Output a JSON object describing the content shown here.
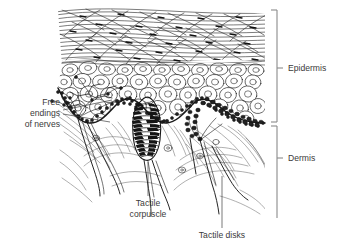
{
  "figure": {
    "width": 340,
    "height": 250,
    "background_color": "#ffffff",
    "ink_color": "#1a1a1a",
    "label_color": "#3a3a3a",
    "bracket_color": "#8a8a8a"
  },
  "labels": {
    "epidermis": "Epidermis",
    "dermis": "Dermis",
    "free_endings_line1": "Free",
    "free_endings_line2": "endings",
    "free_endings_line3": "of nerves",
    "tactile_corpuscle_line1": "Tactile",
    "tactile_corpuscle_line2": "corpuscle",
    "tactile_disks": "Tactile disks"
  },
  "regions": [
    {
      "name": "epidermis",
      "label": "Epidermis",
      "bracket_top": 10,
      "bracket_bottom": 122,
      "label_x": 288,
      "label_y": 70
    },
    {
      "name": "dermis",
      "label": "Dermis",
      "bracket_top": 126,
      "bracket_bottom": 218,
      "label_x": 288,
      "label_y": 158
    }
  ],
  "structures": [
    {
      "name": "stratum-corneum",
      "description": "Wavy keratinized horizontal fiber layer at the top of the epidermis"
    },
    {
      "name": "stratum-spinosum",
      "description": "Polygonal nucleated cells forming the bulk of the epidermis"
    },
    {
      "name": "stratum-basale",
      "description": "Dark granular basal cell layer following the dermal papillae contour"
    },
    {
      "name": "tactile-corpuscle",
      "description": "Elongated oval Meissner corpuscle with stacked lamellae inside a dermal papilla"
    },
    {
      "name": "tactile-disks",
      "description": "Merkel disk cluster on the right dermal papilla"
    },
    {
      "name": "free-nerve-endings",
      "description": "Branching unencapsulated nerve fibers in the left dermal papilla"
    },
    {
      "name": "dermal-connective-fibers",
      "description": "Swirling collagen fiber bundles in the dermis"
    },
    {
      "name": "nerve-fibers",
      "description": "Long myelinated nerve trunks descending into the dermis"
    }
  ],
  "callouts": [
    {
      "name": "free-endings-callout",
      "text_anchor_x": 62,
      "text_anchor_y": 112,
      "target_x": 112,
      "target_y": 108
    },
    {
      "name": "tactile-corpuscle-callout",
      "text_anchor_x": 148,
      "text_anchor_y": 205,
      "target_x": 148,
      "target_y": 160
    },
    {
      "name": "tactile-disks-callout",
      "text_anchor_x": 222,
      "text_anchor_y": 237,
      "target_x": 222,
      "target_y": 175
    }
  ]
}
